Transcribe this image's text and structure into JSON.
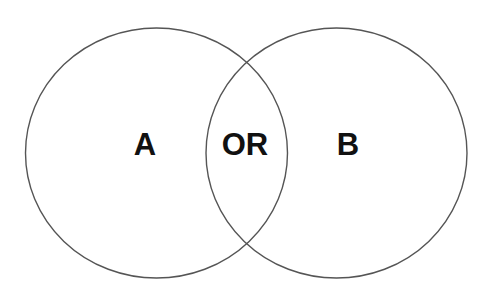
{
  "diagram": {
    "type": "venn",
    "stroke_color": "#555555",
    "background": "#ffffff",
    "text_color": "#111111",
    "sets": [
      {
        "id": "A",
        "label": "A",
        "cx": 156.5,
        "cy": 153,
        "rx": 131,
        "ry": 125
      },
      {
        "id": "B",
        "label": "B",
        "cx": 336.5,
        "cy": 153,
        "rx": 130.5,
        "ry": 125
      }
    ],
    "intersection": {
      "label": "OR"
    }
  }
}
